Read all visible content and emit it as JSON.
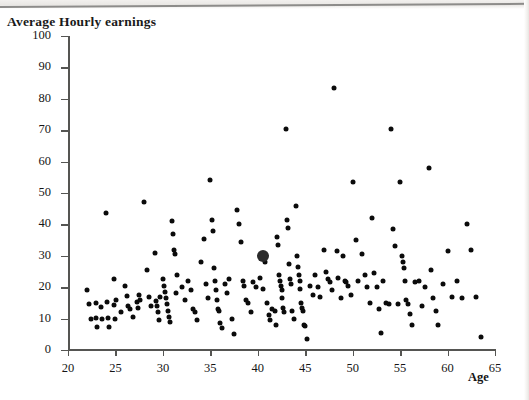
{
  "title": "Average Hourly earnings",
  "axis": {
    "x_label": "Age",
    "y_label": "Average Hourly earnings"
  },
  "chart_data": {
    "type": "scatter",
    "title": "Average Hourly earnings",
    "xlabel": "Age",
    "ylabel": "Average Hourly earnings",
    "xlim": [
      20,
      65
    ],
    "ylim": [
      0,
      100
    ],
    "xticks": [
      20,
      25,
      30,
      35,
      40,
      45,
      50,
      55,
      60,
      65
    ],
    "yticks": [
      0,
      10,
      20,
      30,
      40,
      50,
      60,
      70,
      80,
      90,
      100
    ],
    "grid": false,
    "legend": null,
    "marker_color": "#0b0b0b",
    "highlight": {
      "x": 40.5,
      "y": 30,
      "label": "highlighted mean point",
      "color": "#2b2b2b"
    },
    "points": [
      [
        22.0,
        19.0
      ],
      [
        22.2,
        14.5
      ],
      [
        22.4,
        10.0
      ],
      [
        22.9,
        10.2
      ],
      [
        23.0,
        15.0
      ],
      [
        23.1,
        7.3
      ],
      [
        23.5,
        13.8
      ],
      [
        23.6,
        10.0
      ],
      [
        24.0,
        43.5
      ],
      [
        24.1,
        15.2
      ],
      [
        24.2,
        10.1
      ],
      [
        24.3,
        7.2
      ],
      [
        24.8,
        22.5
      ],
      [
        24.9,
        14.2
      ],
      [
        25.0,
        10.0
      ],
      [
        25.1,
        16.0
      ],
      [
        25.6,
        12.0
      ],
      [
        26.0,
        20.5
      ],
      [
        26.2,
        17.2
      ],
      [
        26.3,
        14.0
      ],
      [
        26.5,
        13.0
      ],
      [
        26.8,
        10.4
      ],
      [
        27.3,
        15.3
      ],
      [
        27.4,
        13.4
      ],
      [
        27.5,
        17.5
      ],
      [
        27.6,
        16.0
      ],
      [
        28.0,
        47.0
      ],
      [
        28.3,
        25.5
      ],
      [
        28.5,
        17.0
      ],
      [
        28.7,
        14.0
      ],
      [
        29.2,
        31.0
      ],
      [
        29.3,
        15.5
      ],
      [
        29.4,
        14.0
      ],
      [
        29.5,
        12.0
      ],
      [
        29.6,
        9.5
      ],
      [
        29.7,
        17.0
      ],
      [
        30.0,
        22.5
      ],
      [
        30.1,
        20.5
      ],
      [
        30.2,
        18.5
      ],
      [
        30.3,
        16.5
      ],
      [
        30.4,
        14.5
      ],
      [
        30.5,
        12.5
      ],
      [
        30.6,
        10.5
      ],
      [
        30.7,
        9.0
      ],
      [
        31.0,
        41.0
      ],
      [
        31.1,
        37.0
      ],
      [
        31.2,
        32.0
      ],
      [
        31.3,
        30.5
      ],
      [
        31.4,
        18.0
      ],
      [
        31.5,
        24.0
      ],
      [
        32.0,
        20.0
      ],
      [
        32.3,
        16.0
      ],
      [
        32.6,
        22.0
      ],
      [
        33.0,
        19.0
      ],
      [
        33.2,
        13.0
      ],
      [
        33.4,
        12.0
      ],
      [
        33.6,
        9.5
      ],
      [
        34.0,
        28.0
      ],
      [
        34.3,
        35.5
      ],
      [
        34.5,
        21.0
      ],
      [
        34.8,
        16.5
      ],
      [
        35.0,
        54.0
      ],
      [
        35.2,
        41.5
      ],
      [
        35.3,
        38.0
      ],
      [
        35.4,
        26.0
      ],
      [
        35.5,
        22.0
      ],
      [
        35.6,
        19.0
      ],
      [
        35.7,
        16.0
      ],
      [
        35.8,
        13.0
      ],
      [
        35.9,
        12.5
      ],
      [
        36.0,
        8.5
      ],
      [
        36.2,
        7.0
      ],
      [
        36.5,
        21.0
      ],
      [
        36.8,
        18.0
      ],
      [
        37.0,
        22.5
      ],
      [
        37.3,
        10.0
      ],
      [
        37.5,
        5.0
      ],
      [
        37.8,
        44.5
      ],
      [
        38.0,
        40.0
      ],
      [
        38.2,
        34.5
      ],
      [
        38.4,
        22.0
      ],
      [
        38.5,
        20.5
      ],
      [
        38.8,
        16.0
      ],
      [
        39.0,
        15.0
      ],
      [
        39.3,
        12.0
      ],
      [
        39.5,
        21.5
      ],
      [
        39.8,
        20.0
      ],
      [
        40.2,
        23.0
      ],
      [
        40.6,
        19.5
      ],
      [
        40.8,
        28.0
      ],
      [
        41.0,
        15.0
      ],
      [
        41.2,
        11.0
      ],
      [
        41.3,
        9.5
      ],
      [
        41.5,
        13.0
      ],
      [
        41.8,
        12.5
      ],
      [
        41.9,
        8.0
      ],
      [
        42.0,
        36.0
      ],
      [
        42.1,
        33.5
      ],
      [
        42.2,
        24.0
      ],
      [
        42.3,
        22.0
      ],
      [
        42.4,
        20.5
      ],
      [
        42.5,
        19.0
      ],
      [
        42.6,
        16.5
      ],
      [
        42.7,
        13.5
      ],
      [
        42.8,
        12.0
      ],
      [
        43.0,
        70.5
      ],
      [
        43.1,
        41.5
      ],
      [
        43.2,
        39.0
      ],
      [
        43.3,
        27.5
      ],
      [
        43.4,
        22.5
      ],
      [
        43.5,
        21.0
      ],
      [
        43.6,
        12.5
      ],
      [
        43.8,
        10.0
      ],
      [
        44.0,
        46.0
      ],
      [
        44.1,
        30.0
      ],
      [
        44.2,
        26.5
      ],
      [
        44.3,
        24.0
      ],
      [
        44.4,
        22.0
      ],
      [
        44.5,
        19.5
      ],
      [
        44.6,
        15.0
      ],
      [
        44.7,
        13.5
      ],
      [
        44.8,
        12.5
      ],
      [
        44.9,
        8.0
      ],
      [
        45.0,
        7.5
      ],
      [
        45.2,
        3.5
      ],
      [
        45.5,
        20.5
      ],
      [
        45.8,
        17.5
      ],
      [
        46.0,
        24.0
      ],
      [
        46.3,
        20.0
      ],
      [
        46.6,
        17.0
      ],
      [
        47.0,
        32.0
      ],
      [
        47.2,
        25.0
      ],
      [
        47.4,
        22.5
      ],
      [
        47.6,
        21.5
      ],
      [
        47.8,
        19.0
      ],
      [
        48.0,
        83.5
      ],
      [
        48.3,
        31.5
      ],
      [
        48.5,
        23.0
      ],
      [
        48.8,
        16.5
      ],
      [
        49.0,
        30.0
      ],
      [
        49.2,
        22.0
      ],
      [
        49.3,
        21.5
      ],
      [
        49.5,
        20.5
      ],
      [
        49.8,
        17.5
      ],
      [
        50.0,
        53.5
      ],
      [
        50.3,
        35.0
      ],
      [
        50.6,
        22.0
      ],
      [
        51.0,
        30.5
      ],
      [
        51.3,
        24.0
      ],
      [
        51.5,
        20.0
      ],
      [
        51.8,
        15.0
      ],
      [
        52.0,
        42.0
      ],
      [
        52.3,
        24.5
      ],
      [
        52.6,
        20.0
      ],
      [
        52.8,
        13.0
      ],
      [
        53.0,
        5.5
      ],
      [
        53.2,
        22.0
      ],
      [
        53.5,
        15.0
      ],
      [
        53.8,
        14.5
      ],
      [
        54.0,
        70.5
      ],
      [
        54.2,
        38.5
      ],
      [
        54.5,
        33.0
      ],
      [
        54.8,
        14.5
      ],
      [
        55.0,
        53.5
      ],
      [
        55.2,
        30.0
      ],
      [
        55.3,
        28.0
      ],
      [
        55.4,
        26.0
      ],
      [
        55.5,
        22.0
      ],
      [
        55.6,
        16.0
      ],
      [
        55.8,
        14.5
      ],
      [
        56.0,
        11.5
      ],
      [
        56.3,
        8.0
      ],
      [
        56.6,
        21.5
      ],
      [
        57.0,
        22.0
      ],
      [
        57.3,
        14.0
      ],
      [
        57.6,
        20.0
      ],
      [
        58.0,
        58.0
      ],
      [
        58.3,
        25.5
      ],
      [
        58.5,
        16.5
      ],
      [
        58.8,
        12.5
      ],
      [
        59.0,
        8.0
      ],
      [
        59.5,
        21.0
      ],
      [
        60.0,
        31.5
      ],
      [
        60.5,
        17.0
      ],
      [
        61.0,
        22.0
      ],
      [
        61.5,
        16.5
      ],
      [
        62.0,
        40.0
      ],
      [
        62.5,
        32.0
      ],
      [
        63.0,
        17.0
      ],
      [
        63.5,
        4.0
      ]
    ]
  }
}
